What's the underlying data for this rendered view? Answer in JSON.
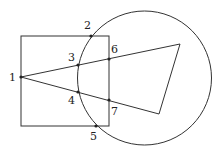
{
  "diagram": {
    "shapes": {
      "square": {
        "x": 21,
        "y": 36,
        "w": 88,
        "h": 90
      },
      "circle": {
        "cx": 144.5,
        "cy": 78,
        "r": 67
      },
      "triangle": {
        "points": "21,77 180,44 159,114"
      }
    },
    "points": [
      {
        "id": "1",
        "x": 21,
        "y": 77,
        "label": "1",
        "lx": 9,
        "ly": 81
      },
      {
        "id": "2",
        "x": 91,
        "y": 36,
        "label": "2",
        "lx": 84,
        "ly": 29
      },
      {
        "id": "3",
        "x": 78,
        "y": 65,
        "label": "3",
        "lx": 68,
        "ly": 61
      },
      {
        "id": "4",
        "x": 78,
        "y": 92,
        "label": "4",
        "lx": 68,
        "ly": 104
      },
      {
        "id": "5",
        "x": 96,
        "y": 126,
        "label": "5",
        "lx": 90,
        "ly": 140
      },
      {
        "id": "6",
        "x": 109,
        "y": 59,
        "label": "6",
        "lx": 111,
        "ly": 53
      },
      {
        "id": "7",
        "x": 109,
        "y": 100,
        "label": "7",
        "lx": 111,
        "ly": 115
      }
    ]
  }
}
